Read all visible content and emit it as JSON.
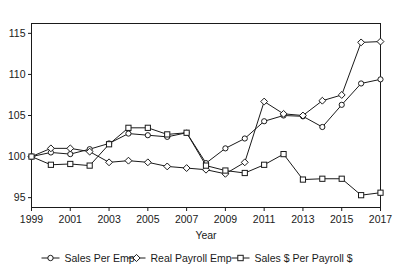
{
  "chart_data": {
    "type": "line",
    "title": "",
    "xlabel": "Year",
    "ylabel": "",
    "x": [
      1999,
      2000,
      2001,
      2002,
      2003,
      2004,
      2005,
      2006,
      2007,
      2008,
      2009,
      2010,
      2011,
      2012,
      2013,
      2014,
      2015,
      2016,
      2017
    ],
    "xlim": [
      1999,
      2017
    ],
    "ylim": [
      93.8,
      116.2
    ],
    "xticks": [
      1999,
      2001,
      2003,
      2005,
      2007,
      2009,
      2011,
      2013,
      2015,
      2017
    ],
    "yticks": [
      95,
      100,
      105,
      110,
      115
    ],
    "grid": false,
    "legend_position": "bottom",
    "series": [
      {
        "name": "Sales Per Emp",
        "marker": "circle",
        "values": [
          100.0,
          100.5,
          100.3,
          100.9,
          101.6,
          102.8,
          102.6,
          102.4,
          102.9,
          99.2,
          101.0,
          102.2,
          104.3,
          105.0,
          104.9,
          103.6,
          106.3,
          108.9,
          109.4
        ]
      },
      {
        "name": "Real Payroll Emp",
        "marker": "diamond",
        "values": [
          100.0,
          101.0,
          101.0,
          100.6,
          99.3,
          99.5,
          99.3,
          98.8,
          98.6,
          98.4,
          97.9,
          99.3,
          106.7,
          105.2,
          105.0,
          106.8,
          107.5,
          113.9,
          114.0
        ]
      },
      {
        "name": "Sales $ Per Payroll $",
        "marker": "square",
        "values": [
          100.0,
          99.0,
          99.1,
          98.9,
          101.5,
          103.5,
          103.5,
          102.7,
          102.9,
          98.9,
          98.3,
          98.0,
          99.0,
          100.3,
          97.2,
          97.3,
          97.3,
          95.3,
          95.6
        ]
      }
    ]
  },
  "legend": {
    "items": [
      {
        "label": "Sales Per Emp",
        "marker": "circle"
      },
      {
        "label": "Real Payroll Emp",
        "marker": "diamond"
      },
      {
        "label": "Sales $ Per Payroll $",
        "marker": "square"
      }
    ]
  },
  "axes": {
    "x_title": "Year",
    "x_tick_labels": [
      "1999",
      "2001",
      "2003",
      "2005",
      "2007",
      "2009",
      "2011",
      "2013",
      "2015",
      "2017"
    ],
    "y_tick_labels": [
      "95",
      "100",
      "105",
      "110",
      "115"
    ]
  },
  "colors": {
    "line": "#1a1a1a",
    "marker_fill": "#ffffff",
    "axis": "#1a1a1a",
    "background": "#ffffff"
  }
}
